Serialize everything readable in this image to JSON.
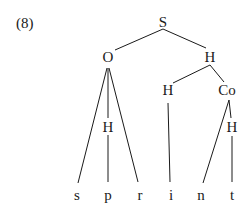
{
  "example_number": "(8)",
  "tree": {
    "nodes": [
      {
        "id": "S",
        "label": "S",
        "x": 163,
        "y": 22
      },
      {
        "id": "O",
        "label": "O",
        "x": 108,
        "y": 57
      },
      {
        "id": "H1",
        "label": "H",
        "x": 210,
        "y": 57
      },
      {
        "id": "H2",
        "label": "H",
        "x": 168,
        "y": 90
      },
      {
        "id": "Co",
        "label": "Co",
        "x": 227,
        "y": 90
      },
      {
        "id": "H3",
        "label": "H",
        "x": 108,
        "y": 127
      },
      {
        "id": "H4",
        "label": "H",
        "x": 232,
        "y": 127
      },
      {
        "id": "s",
        "label": "s",
        "x": 77,
        "y": 195
      },
      {
        "id": "p",
        "label": "p",
        "x": 108,
        "y": 195
      },
      {
        "id": "r",
        "label": "r",
        "x": 140,
        "y": 195
      },
      {
        "id": "i",
        "label": "i",
        "x": 171,
        "y": 195
      },
      {
        "id": "n",
        "label": "n",
        "x": 201,
        "y": 195
      },
      {
        "id": "t",
        "label": "t",
        "x": 232,
        "y": 195
      }
    ]
  }
}
